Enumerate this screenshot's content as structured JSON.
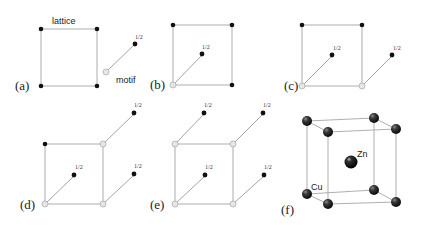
{
  "figure": {
    "panels": [
      {
        "id": "a",
        "label": "(a)",
        "lattice_label": "lattice",
        "motif_label": "motif",
        "half_labels": [
          "1/2"
        ]
      },
      {
        "id": "b",
        "label": "(b)",
        "half_labels": [
          "1/2"
        ]
      },
      {
        "id": "c",
        "label": "(c)",
        "half_labels": [
          "1/2",
          "1/2"
        ]
      },
      {
        "id": "d",
        "label": "(d)",
        "half_labels": [
          "1/2",
          "1/2",
          "1/2"
        ]
      },
      {
        "id": "e",
        "label": "(e)",
        "half_labels": [
          "1/2",
          "1/2",
          "1/2",
          "1/2"
        ]
      },
      {
        "id": "f",
        "label": "(f)",
        "atom_labels": {
          "corner": "Cu",
          "center": "Zn"
        }
      }
    ],
    "colors": {
      "lattice_point": "#111111",
      "motif_origin": "#e6e6e6",
      "edge": "#9a9a9a",
      "atom": "#2a2a2a"
    }
  }
}
